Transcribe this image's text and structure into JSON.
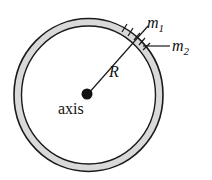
{
  "diagram": {
    "type": "rotating-ring",
    "labels": {
      "m1": "m",
      "m1_sub": "1",
      "m2": "m",
      "m2_sub": "2",
      "radius": "R",
      "axis": "axis"
    },
    "colors": {
      "ring_fill": "#d9d9d9",
      "stroke": "#1a1a1a",
      "background": "#ffffff"
    }
  }
}
